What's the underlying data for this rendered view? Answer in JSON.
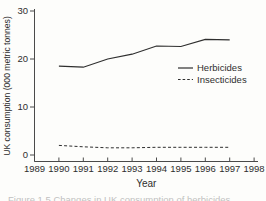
{
  "figure": {
    "background": "#fdfdfb",
    "ink_color": "#2e2e2e",
    "axis_color": "#4a4a4a",
    "caption_partial": "Figure 1.5 Changes in UK consumption of herbicides"
  },
  "chart_data": {
    "type": "line",
    "title": "",
    "xlabel": "Year",
    "ylabel": "UK consumption (000 metric tonnes)",
    "xlim": [
      1989,
      1998
    ],
    "ylim": [
      0,
      30
    ],
    "x_ticks": [
      1989,
      1990,
      1991,
      1992,
      1993,
      1994,
      1995,
      1996,
      1997,
      1998
    ],
    "y_ticks": [
      0,
      10,
      20,
      30
    ],
    "grid": false,
    "legend_position": "right-middle",
    "x": [
      1990,
      1991,
      1992,
      1993,
      1994,
      1995,
      1996,
      1997
    ],
    "series": [
      {
        "name": "Herbicides",
        "line_style": "solid",
        "values": [
          18.5,
          18.3,
          20.0,
          21.0,
          22.7,
          22.6,
          24.1,
          24.0
        ]
      },
      {
        "name": "Insecticides",
        "line_style": "dashed",
        "values": [
          2.0,
          1.7,
          1.5,
          1.5,
          1.6,
          1.6,
          1.6,
          1.6
        ]
      }
    ]
  }
}
